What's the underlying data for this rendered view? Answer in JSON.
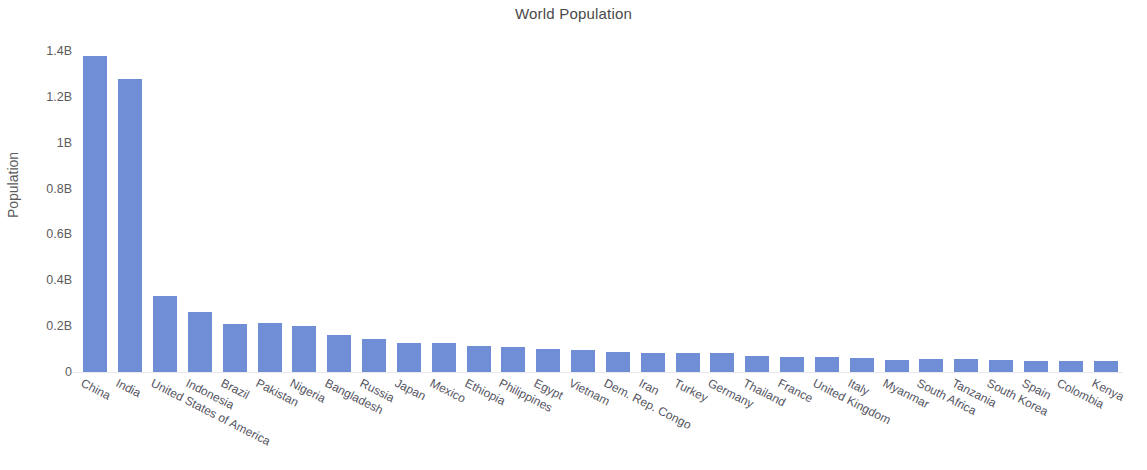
{
  "chart_data": {
    "type": "bar",
    "title": "World Population",
    "xlabel": "",
    "ylabel": "Population",
    "ylim": [
      0,
      1400000000
    ],
    "grid": false,
    "legend": null,
    "orientation": "vertical",
    "bar_color": "#6f8ed6",
    "y_tick_labels": [
      "1.4B",
      "1.2B",
      "1B",
      "0.8B",
      "0.6B",
      "0.4B",
      "0.2B",
      "0"
    ],
    "y_tick_values": [
      1400000000,
      1200000000,
      1000000000,
      800000000,
      600000000,
      400000000,
      200000000,
      0
    ],
    "categories": [
      "China",
      "India",
      "United States of America",
      "Indonesia",
      "Brazil",
      "Pakistan",
      "Nigeria",
      "Bangladesh",
      "Russia",
      "Japan",
      "Mexico",
      "Ethiopia",
      "Philippines",
      "Egypt",
      "Vietnam",
      "Dem. Rep. Congo",
      "Iran",
      "Turkey",
      "Germany",
      "Thailand",
      "France",
      "United Kingdom",
      "Italy",
      "Myanmar",
      "South Africa",
      "Tanzania",
      "South Korea",
      "Spain",
      "Colombia",
      "Kenya"
    ],
    "values": [
      1380000000,
      1280000000,
      331000000,
      262000000,
      210000000,
      212000000,
      200000000,
      161000000,
      144000000,
      127000000,
      128000000,
      112000000,
      108000000,
      100000000,
      96000000,
      87000000,
      83000000,
      82000000,
      82000000,
      70000000,
      67000000,
      66000000,
      60000000,
      54000000,
      58000000,
      58000000,
      51000000,
      47000000,
      50000000,
      48000000
    ]
  }
}
